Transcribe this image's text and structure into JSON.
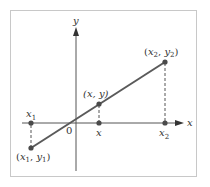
{
  "figure": {
    "axes": {
      "x_label": "x",
      "y_label": "y",
      "origin_label": "0"
    },
    "points": {
      "p1": {
        "x": "x",
        "xsub": "1",
        "y": "y",
        "ysub": "1"
      },
      "p": {
        "label": "(x, y)"
      },
      "p2": {
        "x": "x",
        "xsub": "2",
        "y": "y",
        "ysub": "2"
      }
    },
    "ticks": {
      "x1": {
        "base": "x",
        "sub": "1"
      },
      "x": {
        "base": "x"
      },
      "x2": {
        "base": "x",
        "sub": "2"
      }
    },
    "colors": {
      "line": "#5a5a5a",
      "axis": "#555555",
      "point": "#4a4a4a",
      "frame": "#c8c8c8",
      "text": "#333333"
    }
  }
}
